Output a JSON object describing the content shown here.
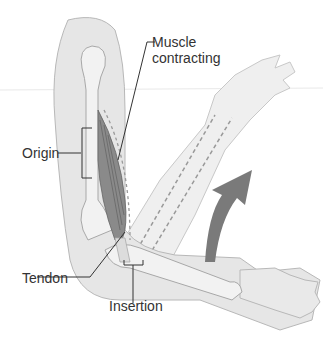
{
  "diagram": {
    "labels": {
      "muscle_line1": "Muscle",
      "muscle_line2": "contracting",
      "origin": "Origin",
      "tendon": "Tendon",
      "insertion": "Insertion"
    },
    "colors": {
      "skin": "#e6e6e6",
      "skin_outline": "#b8b8b8",
      "bone": "#f2f2f2",
      "muscle": "#8a8a8a",
      "arrow": "#7a7a7a",
      "leader_line": "#333333",
      "text": "#333333"
    }
  }
}
